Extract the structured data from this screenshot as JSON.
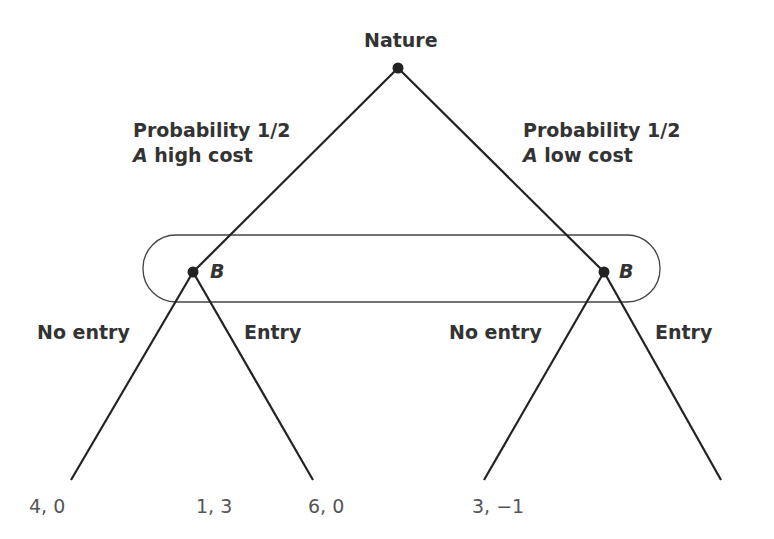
{
  "tree": {
    "root": {
      "label": "Nature"
    },
    "branches": [
      {
        "probability_label": "Probability 1/2",
        "player": "A",
        "type_label": "high cost"
      },
      {
        "probability_label": "Probability 1/2",
        "player": "A",
        "type_label": "low cost"
      }
    ],
    "decision_nodes": [
      {
        "label": "B"
      },
      {
        "label": "B"
      }
    ],
    "actions": [
      "No entry",
      "Entry",
      "No entry",
      "Entry"
    ],
    "payoffs": [
      "4, 0",
      "1, 3",
      "6, 0",
      "3, −1"
    ],
    "information_set": "B nodes enclosed in one information set"
  }
}
